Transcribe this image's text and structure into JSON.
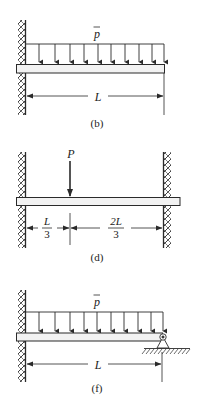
{
  "figures": [
    {
      "id": "b",
      "caption": "(b)",
      "description": "Cantilever beam fixed at left wall with uniform distributed load",
      "load_label": "p̄",
      "load_symbol": "p",
      "dimension_label": "L",
      "support_left": "fixed",
      "support_right": "free"
    },
    {
      "id": "d",
      "caption": "(d)",
      "description": "Fixed-fixed beam with concentrated load P at L/3 from left",
      "load_label": "P",
      "dimensions": [
        {
          "num": "L",
          "den": "3"
        },
        {
          "num": "2L",
          "den": "3"
        }
      ],
      "support_left": "fixed",
      "support_right": "fixed"
    },
    {
      "id": "f",
      "caption": "(f)",
      "description": "Propped cantilever: fixed at left, pin support at right, uniform distributed load",
      "load_label": "p̄",
      "load_symbol": "p",
      "dimension_label": "L",
      "support_left": "fixed",
      "support_right": "pin"
    }
  ],
  "colors": {
    "line": "#2a2a2a",
    "beam_fill": "#f2f2f2",
    "background": "#ffffff"
  }
}
